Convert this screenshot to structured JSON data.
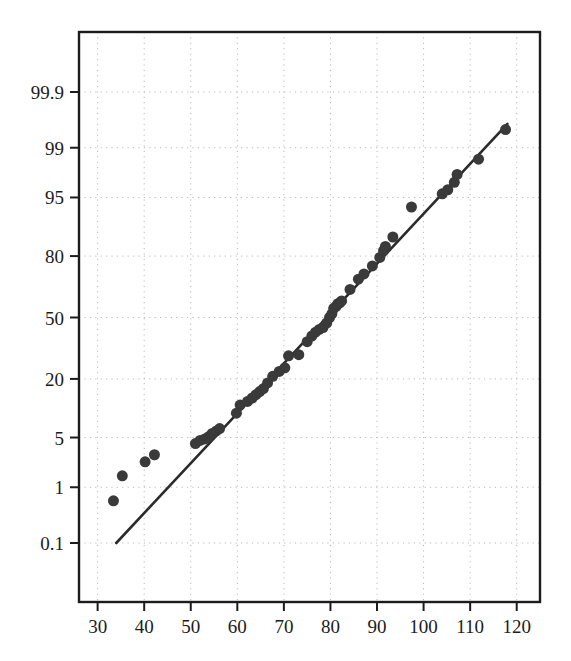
{
  "chart_data": {
    "type": "scatter",
    "title": "",
    "subtitle": "",
    "xlabel": "",
    "ylabel": "",
    "plot_kind": "normal-probability-plot",
    "grid": true,
    "legend": null,
    "xlim": [
      26,
      125
    ],
    "ylim_percent": [
      0.02,
      99.98
    ],
    "x_ticks": [
      30,
      40,
      50,
      60,
      70,
      80,
      90,
      100,
      110,
      120
    ],
    "x_tick_labels": [
      "30",
      "40",
      "50",
      "60",
      "70",
      "80",
      "90",
      "100",
      "110",
      "120"
    ],
    "y_ticks_percent": [
      0.1,
      1,
      5,
      20,
      50,
      80,
      95,
      99,
      99.9
    ],
    "y_tick_labels": [
      "0.1",
      "1",
      "5",
      "20",
      "50",
      "80",
      "95",
      "99",
      "99.9"
    ],
    "marker_color": "#3a3a3a",
    "marker_shape": "circle",
    "marker_size_px": 11,
    "line_color": "#2b2b2b",
    "line_width_px": 2.6,
    "grid_color": "#b9b9b9",
    "frame_color": "#1c1c1c",
    "background": "#ffffff",
    "series": [
      {
        "name": "data",
        "x": [
          33.4,
          35.3,
          40.2,
          42.2,
          51.0,
          52.0,
          53.0,
          53.8,
          54.6,
          55.5,
          56.2,
          59.8,
          60.6,
          62.2,
          63.2,
          64.0,
          64.8,
          65.6,
          66.5,
          67.6,
          69.0,
          70.2,
          71.0,
          73.2,
          75.0,
          76.0,
          76.8,
          77.6,
          78.4,
          79.2,
          79.8,
          80.3,
          80.7,
          81.2,
          81.6,
          82.0,
          82.4,
          84.2,
          86.0,
          87.2,
          89.0,
          90.6,
          91.4,
          91.8,
          93.4,
          97.4,
          104.0,
          105.2,
          106.6,
          107.2,
          111.8,
          117.6
        ],
        "y_percent": [
          0.6,
          1.5,
          2.4,
          3.0,
          4.2,
          4.6,
          4.8,
          5.1,
          5.6,
          6.0,
          6.4,
          9.5,
          11.5,
          12.5,
          13.5,
          14.5,
          15.5,
          16.5,
          18.5,
          21.0,
          23.0,
          24.5,
          30.0,
          30.5,
          37.0,
          40.0,
          42.0,
          43.5,
          44.5,
          47.0,
          50.0,
          52.0,
          55.0,
          56.0,
          57.5,
          58.0,
          59.0,
          65.0,
          70.0,
          72.5,
          76.0,
          79.5,
          82.0,
          83.5,
          86.5,
          93.5,
          95.5,
          96.0,
          96.8,
          97.5,
          98.5,
          99.5
        ]
      }
    ],
    "fit_line": {
      "name": "reference-line",
      "x_start": 34.0,
      "y_percent_start": 0.1,
      "x_end": 118.0,
      "y_percent_end": 99.6
    }
  }
}
